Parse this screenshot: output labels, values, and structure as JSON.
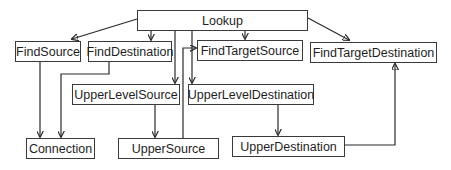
{
  "diagram": {
    "type": "class-dependency-graph",
    "nodes": [
      {
        "id": "lookup",
        "label": "Lookup"
      },
      {
        "id": "findsource",
        "label": "FindSource"
      },
      {
        "id": "finddestination",
        "label": "FindDestination"
      },
      {
        "id": "findtargetsource",
        "label": "FindTargetSource"
      },
      {
        "id": "findtargetdestination",
        "label": "FindTargetDestination"
      },
      {
        "id": "upperlevelsource",
        "label": "UpperLevelSource"
      },
      {
        "id": "upperleveldestination",
        "label": "UpperLevelDestination"
      },
      {
        "id": "connection",
        "label": "Connection"
      },
      {
        "id": "uppersource",
        "label": "UpperSource"
      },
      {
        "id": "upperdestination",
        "label": "UpperDestination"
      }
    ],
    "edges": [
      {
        "from": "Lookup",
        "to": "FindSource"
      },
      {
        "from": "Lookup",
        "to": "FindDestination"
      },
      {
        "from": "Lookup",
        "to": "FindTargetSource"
      },
      {
        "from": "Lookup",
        "to": "FindTargetDestination"
      },
      {
        "from": "Lookup",
        "to": "UpperLevelSource"
      },
      {
        "from": "Lookup",
        "to": "UpperLevelDestination"
      },
      {
        "from": "FindSource",
        "to": "Connection"
      },
      {
        "from": "FindDestination",
        "to": "Connection"
      },
      {
        "from": "UpperLevelSource",
        "to": "UpperSource"
      },
      {
        "from": "UpperLevelDestination",
        "to": "UpperDestination"
      },
      {
        "from": "UpperSource",
        "to": "FindTargetSource"
      },
      {
        "from": "UpperDestination",
        "to": "FindTargetDestination"
      }
    ],
    "colors": {
      "stroke": "#2a2a2a",
      "text": "#1e1e1e",
      "background": "#ffffff"
    }
  }
}
